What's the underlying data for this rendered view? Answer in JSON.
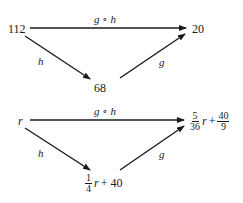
{
  "diagram_top": {
    "source": "112",
    "target": "20",
    "middle": "68",
    "top_arrow_label": "g ∘ h",
    "left_arrow_label": "h",
    "right_arrow_label": "g"
  },
  "diagram_bottom": {
    "source": "r",
    "target": {
      "frac1_num": "5",
      "frac1_den": "36",
      "var": "r",
      "plus": "+",
      "frac2_num": "40",
      "frac2_den": "9"
    },
    "middle": {
      "frac_num": "1",
      "frac_den": "4",
      "var": "r",
      "rest": "+ 40"
    },
    "top_arrow_label": "g ∘ h",
    "left_arrow_label": "h",
    "right_arrow_label": "g"
  },
  "colors": {
    "ink": "#1a1a1a",
    "background": "#ffffff"
  }
}
